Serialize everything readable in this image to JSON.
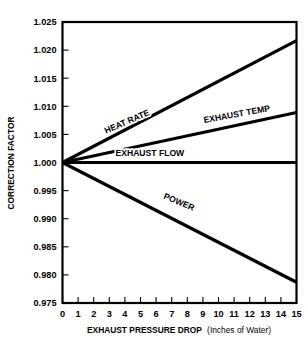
{
  "chart_data": {
    "type": "line",
    "title": "",
    "xlabel": "EXHAUST PRESSURE DROP (Inches of Water)",
    "xlabel_main": "EXHAUST PRESSURE DROP",
    "xlabel_paren": "(Inches of Water)",
    "ylabel": "CORRECTION FACTOR",
    "xlim": [
      0,
      15
    ],
    "ylim": [
      0.975,
      1.025
    ],
    "grid": false,
    "legend": "inline-labels",
    "xticks": [
      0,
      1,
      2,
      3,
      4,
      5,
      6,
      7,
      8,
      9,
      10,
      11,
      12,
      13,
      14,
      15
    ],
    "xticklabels": [
      "0",
      "1",
      "2",
      "3",
      "4",
      "5",
      "6",
      "7",
      "8",
      "9",
      "10",
      "11",
      "12",
      "13",
      "14",
      "15"
    ],
    "yticks": [
      0.975,
      0.98,
      0.985,
      0.99,
      0.995,
      1.0,
      1.005,
      1.01,
      1.015,
      1.02,
      1.025
    ],
    "yticklabels": [
      "0.975",
      "0.980",
      "0.985",
      "0.990",
      "0.995",
      "1.000",
      "1.005",
      "1.010",
      "1.015",
      "1.020",
      "1.025"
    ],
    "x": [
      0,
      15
    ],
    "series": [
      {
        "name": "HEAT RATE",
        "label": "HEAT RATE",
        "values": [
          1.0,
          1.0217
        ],
        "color": "#000000",
        "label_x": 4.2,
        "label_y": 1.0068,
        "label_rotation": -23.5
      },
      {
        "name": "EXHAUST TEMP",
        "label": "EXHAUST TEMP",
        "values": [
          1.0,
          1.0089
        ],
        "color": "#000000",
        "label_x": 11.2,
        "label_y": 1.0081,
        "label_rotation": -10.5
      },
      {
        "name": "EXHAUST FLOW",
        "label": "EXHAUST FLOW",
        "values": [
          1.0,
          1.0
        ],
        "color": "#000000",
        "label_x": 5.6,
        "label_y": 1.0011,
        "label_rotation": 0
      },
      {
        "name": "POWER",
        "label": "POWER",
        "values": [
          1.0,
          0.9787
        ],
        "color": "#000000",
        "label_x": 7.4,
        "label_y": 0.9925,
        "label_rotation": 23.0
      }
    ]
  }
}
